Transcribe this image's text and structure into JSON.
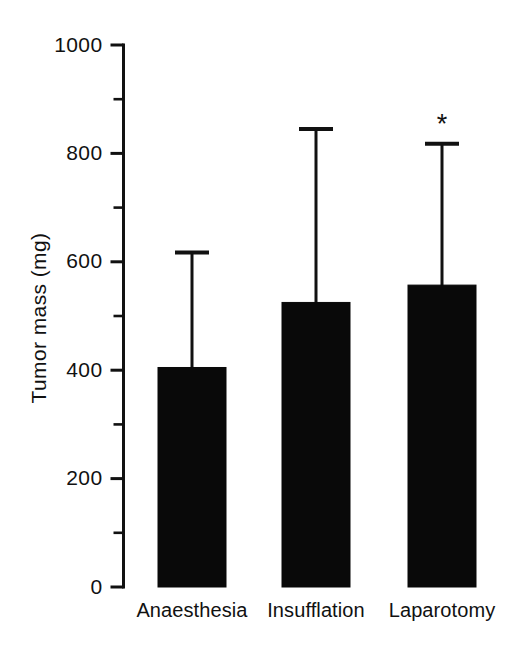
{
  "chart_data": {
    "type": "bar",
    "title": "",
    "subtitle": "",
    "xlabel": "",
    "ylabel": "Tumor mass (mg)",
    "categories": [
      "Anaesthesia",
      "Insufflation",
      "Laparotomy"
    ],
    "values": [
      405,
      525,
      557
    ],
    "error_upper": [
      617,
      845,
      818
    ],
    "series": [
      {
        "name": "Tumor mass",
        "values": [
          405,
          525,
          557
        ],
        "error_upper": [
          617,
          845,
          818
        ]
      }
    ],
    "ylim": [
      0,
      1000
    ],
    "y_major_ticks": [
      0,
      200,
      400,
      600,
      800,
      1000
    ],
    "y_minor_ticks": [
      100,
      300,
      500,
      700,
      900
    ],
    "y_tick_labels": [
      "0",
      "200",
      "400",
      "600",
      "800",
      "1000"
    ],
    "grid": false,
    "legend": false,
    "legend_position": "none",
    "bar_color": "#090909",
    "axis_color": "#111111",
    "background_color": "#ffffff",
    "annotations": [
      {
        "text": "*",
        "category": "Laparotomy",
        "value": 860,
        "meaning": "significance-marker"
      }
    ],
    "error_bar_style": "upper-only-with-cap"
  },
  "figure": {
    "bars": [
      {
        "label": "Anaesthesia",
        "value": 405,
        "error_top": 617,
        "star": ""
      },
      {
        "label": "Insufflation",
        "value": 525,
        "error_top": 845,
        "star": ""
      },
      {
        "label": "Laparotomy",
        "value": 557,
        "error_top": 818,
        "star": "*"
      }
    ]
  }
}
